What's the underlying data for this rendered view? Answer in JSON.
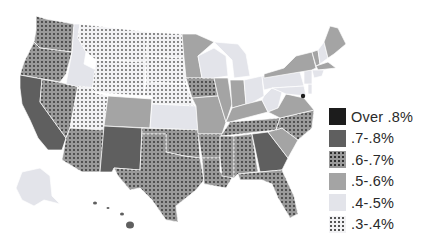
{
  "map": {
    "subject": "United States map by state",
    "categories": [
      {
        "key": "over8",
        "label": "Over .8%",
        "fill": "#1c1c1c",
        "pattern": "solid"
      },
      {
        "key": "7to8",
        "label": ".7-.8%",
        "fill": "#5f5f5f",
        "pattern": "solid"
      },
      {
        "key": "6to7",
        "label": ".6-.7%",
        "fill": "#9a9a9a",
        "pattern": "dotted-dark"
      },
      {
        "key": "5to6",
        "label": ".5-.6%",
        "fill": "#a4a4a4",
        "pattern": "solid"
      },
      {
        "key": "4to5",
        "label": ".4-.5%",
        "fill": "#e3e4ea",
        "pattern": "solid"
      },
      {
        "key": "3to4",
        "label": ".3-.4%",
        "fill": "#f2f2f4",
        "pattern": "dotted-light"
      }
    ]
  },
  "legend": {
    "items": [
      {
        "label": "Over .8%"
      },
      {
        "label": ".7-.8%"
      },
      {
        "label": ".6-.7%"
      },
      {
        "label": ".5-.6%"
      },
      {
        "label": ".4-.5%"
      },
      {
        "label": ".3-.4%"
      }
    ]
  }
}
